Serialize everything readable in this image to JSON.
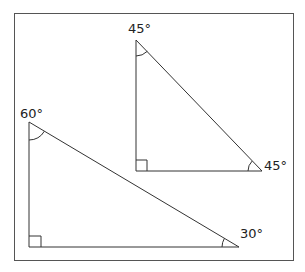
{
  "diagram": {
    "colors": {
      "stroke": "#333333",
      "frame": "#555555",
      "background": "#ffffff",
      "text": "#222222"
    },
    "triangles": [
      {
        "name": "45-45-90",
        "vertices": {
          "top": [
            136,
            40
          ],
          "right_angle": [
            136,
            171
          ],
          "base_right": [
            262,
            171
          ]
        },
        "angle_labels": [
          {
            "vertex": "top",
            "text": "45°",
            "x": 128,
            "y": 33
          },
          {
            "vertex": "base_right",
            "text": "45°",
            "x": 264,
            "y": 170
          }
        ],
        "right_angle_marker": true
      },
      {
        "name": "30-60-90",
        "vertices": {
          "top": [
            29,
            122
          ],
          "right_angle": [
            29,
            247
          ],
          "base_right": [
            239,
            247
          ]
        },
        "angle_labels": [
          {
            "vertex": "top",
            "text": "60°",
            "x": 20,
            "y": 118
          },
          {
            "vertex": "base_right",
            "text": "30°",
            "x": 240,
            "y": 238
          }
        ],
        "right_angle_marker": true
      }
    ],
    "labels": {
      "t1_top": "45°",
      "t1_right": "45°",
      "t2_top": "60°",
      "t2_right": "30°"
    }
  }
}
